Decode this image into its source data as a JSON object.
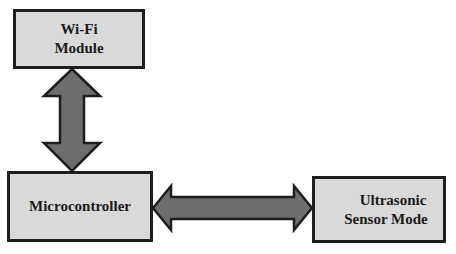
{
  "diagram": {
    "nodes": [
      {
        "id": "wifi",
        "label_line1": "Wi-Fi",
        "label_line2": "Module"
      },
      {
        "id": "mcu",
        "label": "Microcontroller"
      },
      {
        "id": "ultrasonic",
        "label_line1": "Ultrasonic",
        "label_line2": "Sensor Mode"
      }
    ],
    "edges": [
      {
        "from": "wifi",
        "to": "mcu",
        "type": "bidirectional"
      },
      {
        "from": "mcu",
        "to": "ultrasonic",
        "type": "bidirectional"
      }
    ]
  },
  "colors": {
    "box_fill": "#d9d9d9",
    "box_border": "#1e1e1e",
    "arrow_fill": "#6e6e6e",
    "arrow_stroke": "#1e1e1e"
  }
}
